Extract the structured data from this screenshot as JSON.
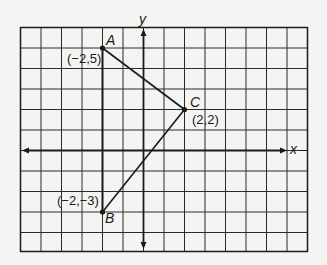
{
  "diagram": {
    "type": "coordinate-plane-triangle",
    "grid": {
      "columns": 14,
      "rows": 11,
      "x_range": [
        -6,
        8
      ],
      "y_range": [
        -5,
        6
      ]
    },
    "axes": {
      "x_label": "x",
      "y_label": "y"
    },
    "points": [
      {
        "name": "A",
        "coord_label": "(−2,5)",
        "x": -2,
        "y": 5
      },
      {
        "name": "B",
        "coord_label": "(−2,−3)",
        "x": -2,
        "y": -3
      },
      {
        "name": "C",
        "coord_label": "(2,2)",
        "x": 2,
        "y": 2
      }
    ],
    "segments": [
      [
        "A",
        "C"
      ],
      [
        "C",
        "B"
      ]
    ],
    "colors": {
      "background": "#f4f4f2",
      "ink": "#1a1a1a",
      "grid": "#2a2a2a"
    }
  }
}
